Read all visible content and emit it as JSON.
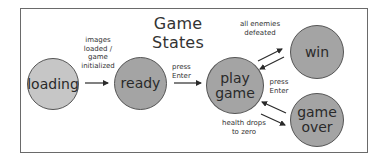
{
  "diagram": {
    "title": "Game States",
    "states": [
      {
        "id": "loading",
        "label": "loading",
        "fill": "#c6c6c6"
      },
      {
        "id": "ready",
        "label": "ready",
        "fill": "#a4a4a4"
      },
      {
        "id": "play_game",
        "label_line1": "play",
        "label_line2": "game",
        "fill": "#a4a4a4"
      },
      {
        "id": "win",
        "label": "win",
        "fill": "#a4a4a4"
      },
      {
        "id": "game_over",
        "label_line1": "game",
        "label_line2": "over",
        "fill": "#a4a4a4"
      }
    ],
    "transitions": [
      {
        "from": "loading",
        "to": "ready",
        "label_lines": [
          "images",
          "loaded /",
          "game",
          "initialized"
        ]
      },
      {
        "from": "ready",
        "to": "play_game",
        "label_lines": [
          "press",
          "Enter"
        ]
      },
      {
        "from": "play_game",
        "to": "win",
        "label_lines": [
          "all enemies",
          "defeated"
        ]
      },
      {
        "from": "win",
        "to": "play_game",
        "label_lines": [
          "press",
          "Enter"
        ]
      },
      {
        "from": "game_over",
        "to": "play_game",
        "label_lines": [
          "press",
          "Enter"
        ]
      },
      {
        "from": "play_game",
        "to": "game_over",
        "label_lines": [
          "health drops",
          "to zero"
        ]
      }
    ]
  }
}
